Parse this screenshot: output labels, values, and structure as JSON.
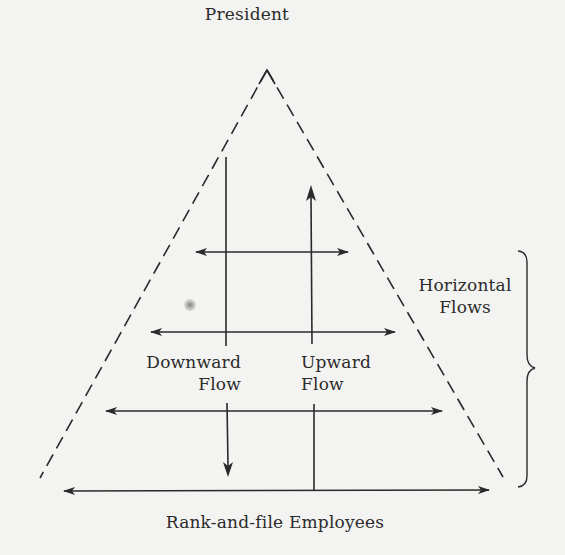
{
  "diagram": {
    "type": "organizational-communication-flow-pyramid",
    "top_label": "President",
    "bottom_label": "Rank-and-file Employees",
    "downward_label": {
      "line1": "Downward",
      "line2": "Flow"
    },
    "upward_label": {
      "line1": "Upward",
      "line2": "Flow"
    },
    "horizontal_label": {
      "line1": "Horizontal",
      "line2": "Flows"
    },
    "colors": {
      "background": "#f3f3f1",
      "ink": "#2a2a2a"
    },
    "elements": {
      "pyramid": {
        "style": "dashed",
        "apex": [
          267,
          70
        ],
        "base_left": [
          40,
          478
        ],
        "base_right": [
          503,
          477
        ]
      },
      "downward_arrow": {
        "x": 227,
        "from_y": 157,
        "to_y": 477,
        "direction": "down"
      },
      "upward_arrow": {
        "x": 313,
        "from_y": 490,
        "to_y": 185,
        "direction": "up"
      },
      "horizontal_arrows": [
        {
          "y": 252,
          "x1": 193,
          "x2": 350,
          "bidirectional": true
        },
        {
          "y": 332,
          "x1": 149,
          "x2": 397,
          "bidirectional": true
        },
        {
          "y": 411,
          "x1": 104,
          "x2": 444,
          "bidirectional": true
        },
        {
          "y": 490,
          "x1": 62,
          "x2": 490,
          "bidirectional": true
        }
      ],
      "brace": {
        "x": 518,
        "top_y": 250,
        "bottom_y": 487,
        "tip": [
          535,
          368
        ],
        "groups": "horizontal_arrows"
      }
    }
  }
}
